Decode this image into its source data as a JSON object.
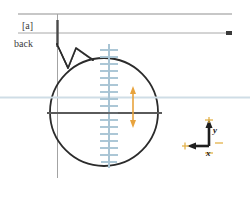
{
  "diagram": {
    "title": "back",
    "annotations": {
      "bracket_label": "[a]",
      "view_label": "back"
    },
    "axis_indicator": {
      "x_label": "x",
      "y_label": "y",
      "x_direction": "left",
      "y_direction": "up",
      "origin_marker": "plus-tick"
    },
    "colors": {
      "outline": "#2b2b2b",
      "guide_gray": "#8c8c8c",
      "centerline_dark": "#5a5a5a",
      "tick_blue": "#a8c4d4",
      "arrow_orange": "#e8a33d",
      "text": "#3b3b3b"
    },
    "shapes": {
      "circle": {
        "cx": 104,
        "cy": 112,
        "r": 54
      },
      "tick_axis": {
        "x": 109,
        "top": 46,
        "bottom": 166,
        "tick_count": 17,
        "tick_spacing": 7
      },
      "dimension_arrow": {
        "x": 133,
        "top": 88,
        "bottom": 126,
        "heads": "double"
      },
      "top_rules": [
        {
          "y": 14
        },
        {
          "y": 33
        }
      ],
      "vertical_guide": {
        "x": 57,
        "top": 14,
        "bottom": 178
      }
    }
  }
}
